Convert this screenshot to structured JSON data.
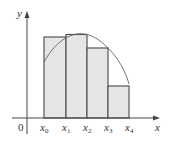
{
  "diagram": {
    "type": "riemann-sum-right-endpoints",
    "axes": {
      "x_label": "x",
      "y_label": "y",
      "origin_label": "0"
    },
    "tick_labels": [
      {
        "base": "x",
        "sub": "0"
      },
      {
        "base": "x",
        "sub": "1"
      },
      {
        "base": "x",
        "sub": "2"
      },
      {
        "base": "x",
        "sub": "3"
      },
      {
        "base": "x",
        "sub": "4"
      }
    ],
    "rectangles": 4,
    "colors": {
      "fill": "#e6e6e6",
      "stroke": "#555555",
      "curve": "#666666",
      "axis": "#444444"
    }
  }
}
